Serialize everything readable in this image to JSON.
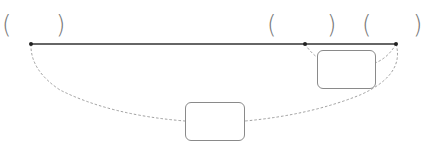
{
  "diagram": {
    "type": "line-segment-division",
    "brackets": [
      {
        "id": "left-pair",
        "open": "(",
        "close": ")",
        "open_x": 2,
        "close_x": 56,
        "y": 13
      },
      {
        "id": "middle-pair",
        "open": "(",
        "close": ")",
        "open_x": 267,
        "close_x": 327,
        "y": 13
      },
      {
        "id": "right-pair",
        "open": "(",
        "close": ")",
        "open_x": 362,
        "close_x": 413,
        "y": 13
      }
    ],
    "points": [
      {
        "id": "left-endpoint",
        "x": 31,
        "y": 44
      },
      {
        "id": "middle-point",
        "x": 305,
        "y": 44
      },
      {
        "id": "right-endpoint",
        "x": 396,
        "y": 44
      }
    ],
    "main_line": {
      "from": "left-endpoint",
      "to": "right-endpoint",
      "color": "#333333"
    },
    "boxes": [
      {
        "id": "small-answer-box",
        "x": 317,
        "y": 50,
        "width": 59,
        "height": 39,
        "spans": [
          "middle-point",
          "right-endpoint"
        ]
      },
      {
        "id": "large-answer-box",
        "x": 185,
        "y": 102,
        "width": 60,
        "height": 39,
        "spans": [
          "left-endpoint",
          "right-endpoint"
        ]
      }
    ],
    "colors": {
      "line": "#333333",
      "dashed": "#888888",
      "box_border": "#8a8a8a",
      "paren": "#777777"
    }
  }
}
